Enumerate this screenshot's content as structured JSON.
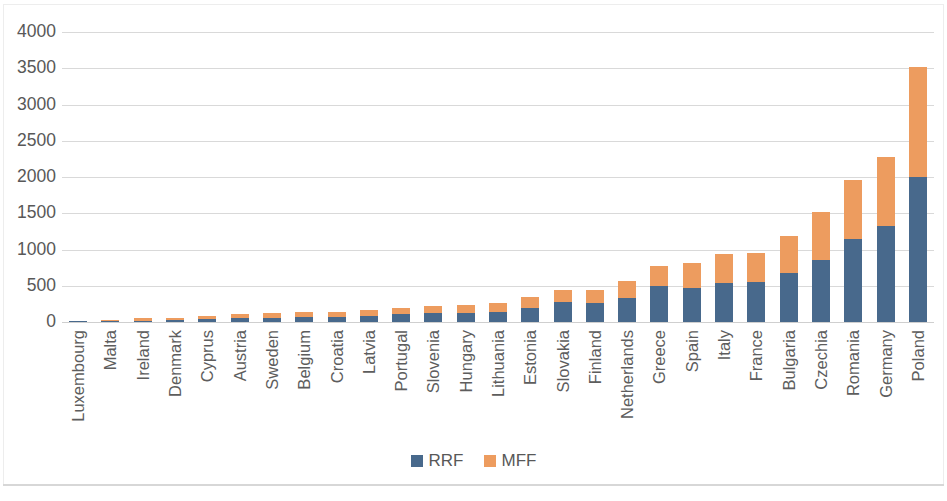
{
  "chart_data": {
    "type": "bar",
    "subtype": "stacked-column",
    "title": "",
    "xlabel": "",
    "ylabel": "",
    "ylim": [
      0,
      4000
    ],
    "ytick_step": 500,
    "yticks": [
      "0",
      "500",
      "1000",
      "1500",
      "2000",
      "2500",
      "3000",
      "3500",
      "4000"
    ],
    "grid": true,
    "legend_position": "bottom",
    "categories": [
      "Luxembourg",
      "Malta",
      "Ireland",
      "Denmark",
      "Cyprus",
      "Austria",
      "Sweden",
      "Belgium",
      "Croatia",
      "Latvia",
      "Portugal",
      "Slovenia",
      "Hungary",
      "Lithuania",
      "Estonia",
      "Slovakia",
      "Finland",
      "Netherlands",
      "Greece",
      "Spain",
      "Italy",
      "France",
      "Bulgaria",
      "Czechia",
      "Romania",
      "Germany",
      "Poland"
    ],
    "series": [
      {
        "name": "RRF",
        "color": "#48698c",
        "values": [
          2,
          8,
          20,
          25,
          35,
          55,
          60,
          70,
          75,
          80,
          105,
          120,
          130,
          140,
          195,
          270,
          265,
          330,
          500,
          465,
          535,
          555,
          680,
          860,
          1140,
          1320,
          2000
        ]
      },
      {
        "name": "MFF",
        "color": "#ed9c5f",
        "values": [
          4,
          14,
          40,
          35,
          45,
          50,
          60,
          65,
          70,
          85,
          95,
          105,
          105,
          120,
          145,
          165,
          170,
          240,
          275,
          345,
          400,
          400,
          500,
          655,
          825,
          950,
          1515
        ]
      }
    ],
    "totals": [
      6,
      22,
      60,
      60,
      80,
      105,
      120,
      135,
      145,
      165,
      200,
      225,
      235,
      260,
      340,
      435,
      435,
      570,
      775,
      810,
      935,
      955,
      1180,
      1515,
      1965,
      2270,
      3515
    ]
  },
  "legend": {
    "items": [
      {
        "label": "RRF",
        "color": "#48698c"
      },
      {
        "label": "MFF",
        "color": "#ed9c5f"
      }
    ]
  },
  "colors": {
    "rrf": "#48698c",
    "mff": "#ed9c5f",
    "gridline": "#d9d9d9",
    "text": "#585858",
    "background": "#ffffff"
  }
}
